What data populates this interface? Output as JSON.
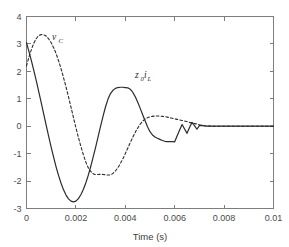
{
  "figure": {
    "background_color": "#ffffff",
    "axis_color": "#7d7d7d",
    "curve_color": "#2b2b2b"
  },
  "axes": {
    "xlabel": "Time (s)",
    "ylabel": "",
    "x_ticks": [
      "0",
      "0.002",
      "0.004",
      "0.006",
      "0.008",
      "0.01"
    ],
    "y_ticks": [
      "4",
      "3",
      "2",
      "1",
      "0",
      "-1",
      "-2",
      "-3"
    ]
  },
  "labels": {
    "series1_main": "v",
    "series1_sub": "C",
    "series2_main": "z",
    "series2_sub1": "0",
    "series2_mid": "i",
    "series2_sub2": "L"
  },
  "chart_data": {
    "type": "line",
    "title": "",
    "xlabel": "Time (s)",
    "ylabel": "",
    "xlim": [
      0,
      0.01
    ],
    "ylim": [
      -3,
      4
    ],
    "xticks": [
      0,
      0.002,
      0.004,
      0.006,
      0.008,
      0.01
    ],
    "yticks": [
      -3,
      -2,
      -1,
      0,
      1,
      2,
      3,
      4
    ],
    "grid": false,
    "legend": "inline-annotations",
    "series": [
      {
        "name": "z0iL",
        "label": "z_0 i_L",
        "style": "solid",
        "color": "#2b2b2b",
        "x": [
          0.0,
          0.0001,
          0.0002,
          0.0003,
          0.0004,
          0.0005,
          0.0006,
          0.0007,
          0.0008,
          0.0009,
          0.001,
          0.0011,
          0.0012,
          0.0013,
          0.0014,
          0.0015,
          0.0016,
          0.0017,
          0.0018,
          0.0019,
          0.002,
          0.0021,
          0.0022,
          0.0023,
          0.0024,
          0.0025,
          0.0026,
          0.0027,
          0.0028,
          0.0029,
          0.003,
          0.0031,
          0.0032,
          0.0033,
          0.0034,
          0.0035,
          0.0036,
          0.0037,
          0.0038,
          0.0039,
          0.004,
          0.0041,
          0.0042,
          0.0043,
          0.0044,
          0.0045,
          0.0046,
          0.0047,
          0.0048,
          0.0049,
          0.005,
          0.0051,
          0.0052,
          0.0053,
          0.0054,
          0.0055,
          0.0056,
          0.0057,
          0.0058,
          0.0059,
          0.006,
          0.0061,
          0.0062,
          0.0063,
          0.0064,
          0.0065,
          0.0066,
          0.0067,
          0.0068,
          0.0069,
          0.007,
          0.0071,
          0.0072,
          0.0073,
          0.0074,
          0.0075,
          0.008,
          0.0085,
          0.009,
          0.0095,
          0.01
        ],
        "y": [
          3.05,
          2.72,
          2.38,
          2.02,
          1.64,
          1.24,
          0.84,
          0.43,
          0.02,
          -0.38,
          -0.77,
          -1.14,
          -1.49,
          -1.8,
          -2.08,
          -2.32,
          -2.51,
          -2.65,
          -2.73,
          -2.76,
          -2.73,
          -2.64,
          -2.5,
          -2.31,
          -2.07,
          -1.79,
          -1.47,
          -1.12,
          -0.76,
          -0.38,
          0.0,
          0.37,
          0.71,
          0.99,
          1.19,
          1.31,
          1.38,
          1.41,
          1.42,
          1.42,
          1.41,
          1.4,
          1.35,
          1.24,
          1.08,
          0.88,
          0.66,
          0.43,
          0.2,
          -0.02,
          -0.2,
          -0.32,
          -0.39,
          -0.44,
          -0.48,
          -0.52,
          -0.55,
          -0.56,
          -0.56,
          -0.56,
          -0.57,
          -0.35,
          -0.14,
          0.06,
          -0.1,
          -0.26,
          -0.05,
          0.14,
          0.02,
          -0.11,
          0.02,
          0.03,
          0.01,
          0.0,
          0.0,
          0.0,
          0.0,
          0.0,
          0.0,
          0.0,
          0.0
        ]
      },
      {
        "name": "vC",
        "label": "v_C",
        "style": "dashed",
        "color": "#2b2b2b",
        "x": [
          0.0,
          0.0001,
          0.0002,
          0.0003,
          0.0004,
          0.0005,
          0.0006,
          0.0007,
          0.0008,
          0.0009,
          0.001,
          0.0011,
          0.0012,
          0.0013,
          0.0014,
          0.0015,
          0.0016,
          0.0017,
          0.0018,
          0.0019,
          0.002,
          0.0021,
          0.0022,
          0.0023,
          0.0024,
          0.0025,
          0.0026,
          0.0027,
          0.0028,
          0.0029,
          0.003,
          0.0031,
          0.0032,
          0.0033,
          0.0034,
          0.0035,
          0.0036,
          0.0037,
          0.0038,
          0.0039,
          0.004,
          0.0041,
          0.0042,
          0.0043,
          0.0044,
          0.0045,
          0.0046,
          0.0047,
          0.0048,
          0.0049,
          0.005,
          0.0051,
          0.0052,
          0.0053,
          0.0054,
          0.0055,
          0.0056,
          0.0057,
          0.0058,
          0.0059,
          0.006,
          0.0061,
          0.0062,
          0.0063,
          0.0064,
          0.0065,
          0.0066,
          0.0067,
          0.0068,
          0.0069,
          0.007,
          0.0071,
          0.0072,
          0.0073,
          0.0074,
          0.0075,
          0.008,
          0.0085,
          0.009,
          0.0095,
          0.01
        ],
        "y": [
          2.2,
          2.52,
          2.8,
          3.03,
          3.2,
          3.3,
          3.34,
          3.33,
          3.28,
          3.18,
          3.04,
          2.86,
          2.64,
          2.38,
          2.09,
          1.77,
          1.43,
          1.07,
          0.7,
          0.32,
          -0.05,
          -0.4,
          -0.73,
          -1.03,
          -1.3,
          -1.51,
          -1.65,
          -1.73,
          -1.76,
          -1.76,
          -1.75,
          -1.76,
          -1.77,
          -1.78,
          -1.77,
          -1.72,
          -1.63,
          -1.51,
          -1.36,
          -1.19,
          -1.0,
          -0.8,
          -0.6,
          -0.41,
          -0.23,
          -0.07,
          0.07,
          0.18,
          0.26,
          0.31,
          0.34,
          0.36,
          0.37,
          0.37,
          0.37,
          0.36,
          0.35,
          0.33,
          0.31,
          0.29,
          0.27,
          0.25,
          0.23,
          0.21,
          0.19,
          0.17,
          0.14,
          0.12,
          0.1,
          0.08,
          0.05,
          0.03,
          0.02,
          0.01,
          0.01,
          0.0,
          0.0,
          0.0,
          0.0,
          0.0,
          0.0
        ]
      }
    ],
    "annotations": [
      {
        "text": "v_C",
        "x": 0.0011,
        "y": 3.2
      },
      {
        "text": "z_0 i_L",
        "x": 0.0044,
        "y": 1.95
      }
    ]
  }
}
